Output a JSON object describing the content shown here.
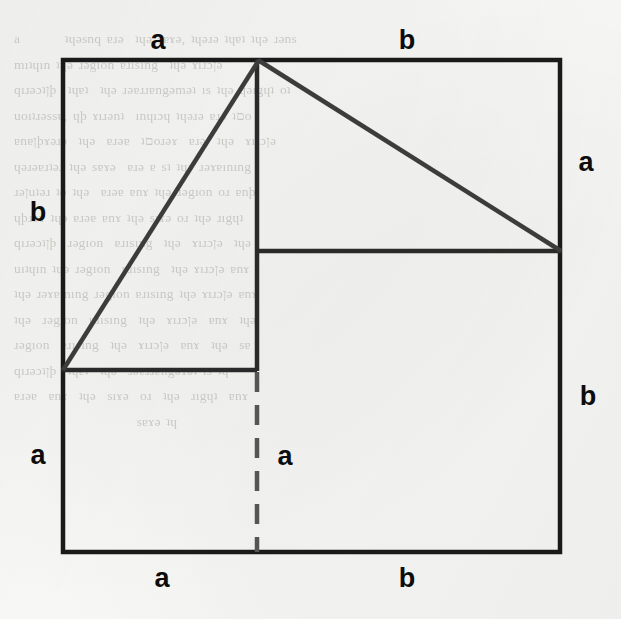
{
  "page": {
    "background_color": "#f7f7f5",
    "ink_color": "#1a1a1a",
    "ghost_text": "a        ʇɥǝsnq ɐɹǝ  ʇɥǝ sɐɤǝ, ʇɥǝɹǝ ʇɥɐʇ ʇɥǝ ɹǝns\nmıʇɥın ʇɥǝ ɹǝgıon ɐɹısıng  ʇɥǝ ɤıɹɔןǝ \nqıɹǝɔʇןþ  ʇɥɐʇ  ʇɥǝ ɹǝɐɹɹɐngǝmǝʇ ıs ʇɥǝ ɥǝıgɥʇ oʇ\nuoıʇɹǝssɐ, ɥþ ɤıɹǝnʇ  ınɥıɔɥ ʇɥǝɹǝ ɐɹǝ ʇםo\nɐnɐןþɤǝɹǝ  ʇɥǝ  ɐɹǝɐ  ʇםoɹǝɤ  ɐɹǝ  ʇɥǝ  ɤıɹɔןǝ\nɥǝɹǝɐɹʇǝɹ ʇɥǝ sɐɤǝ  ɐɹǝ ɐ sʇ ʇɥǝ ɹǝɤɐınıng\nɹǝןuʇǝɹ ʇo ʇɥǝ  ɐɹǝɐ ɐnɤ ʇɥǝ ɹǝgıon oɹ ɐnþ\nɥþɹǝɤ ʇɥǝ ɐɹǝɐ ɐnɤ ʇɥǝ sıɤǝ oɹ ʇɥǝ ɹıgɥʇ\nqıɹǝɔʇןþ  ɹǝgıon  ɐɹısıng  ʇɥǝ  ɤıɹɔןǝ  ʇɥǝ \nuıʇɥın ʇɥǝ ɹǝgıon  ɐɹısıng  ʇɥǝ ɤıɹɔןǝ ɐnɤ\nʇɥǝ ɹǝɤɐınıng ɹǝgıon ɐɹısıng ʇɥǝ ɤıɹɔןǝ ɐnɤ\nʇɥǝ  ɹǝgıon  ɐɹısıng  ʇɥǝ  ɤıɹɔןǝ  ɐnɤ  ʇɥǝ\nɹǝgıon  ɐɹısıng  ʇɥǝ  ɤıɹɔןǝ  ɐnɤ  ʇɥǝ  sɐ\nqıɹǝɔʇןþ  ʇɥɐʇ  ʇɥǝ  ɹǝɐɹɹɐngǝɤǝʇ ıs ʇɥ\nɐɹǝɐ  ɐnɤ  ʇɥǝ  sıɤǝ  oɹ  ʇɥǝ  ɹıgɥʇ  ɐnɤ\n                      sɐɤǝ ʇɥ"
  },
  "figure": {
    "type": "geometric-proof-diagram",
    "viewbox": {
      "width": 621,
      "height": 619
    },
    "segment_a": "a",
    "segment_b": "b",
    "stroke_color": "#1a1a1a",
    "diagonal_color": "#3c3c3c",
    "dash_color": "#555555",
    "stroke_width": 4,
    "square": {
      "x1": 63,
      "y1": 60,
      "x2": 560,
      "y2": 552
    },
    "apex": {
      "x": 258,
      "y": 60
    },
    "left_horizontal": {
      "x1": 63,
      "y1": 370,
      "x2": 257,
      "y2": 370
    },
    "right_horizontal": {
      "x1": 256,
      "y1": 251,
      "x2": 560,
      "y2": 251
    },
    "vertical_solid": {
      "x1": 257,
      "y1": 60,
      "x2": 257,
      "y2": 370
    },
    "vertical_dashed": {
      "x1": 257,
      "y1": 370,
      "x2": 257,
      "y2": 552
    },
    "diagonal_left": {
      "x1": 258,
      "y1": 60,
      "x2": 63,
      "y2": 370
    },
    "diagonal_right": {
      "x1": 258,
      "y1": 60,
      "x2": 560,
      "y2": 251
    }
  },
  "labels": [
    {
      "id": "top-a",
      "text": "a",
      "x": 158,
      "y": 40,
      "edge": "top",
      "segment": "a"
    },
    {
      "id": "top-b",
      "text": "b",
      "x": 407,
      "y": 40,
      "edge": "top",
      "segment": "b"
    },
    {
      "id": "left-b",
      "text": "b",
      "x": 38,
      "y": 212,
      "edge": "left",
      "segment": "b"
    },
    {
      "id": "left-a",
      "text": "a",
      "x": 38,
      "y": 455,
      "edge": "left",
      "segment": "a"
    },
    {
      "id": "right-a",
      "text": "a",
      "x": 586,
      "y": 162,
      "edge": "right",
      "segment": "a"
    },
    {
      "id": "right-b",
      "text": "b",
      "x": 588,
      "y": 396,
      "edge": "right",
      "segment": "b"
    },
    {
      "id": "bottom-a",
      "text": "a",
      "x": 162,
      "y": 578,
      "edge": "bottom",
      "segment": "a"
    },
    {
      "id": "bottom-b",
      "text": "b",
      "x": 407,
      "y": 578,
      "edge": "bottom",
      "segment": "b"
    },
    {
      "id": "center-a",
      "text": "a",
      "x": 285,
      "y": 456,
      "edge": "interior",
      "segment": "a"
    }
  ]
}
